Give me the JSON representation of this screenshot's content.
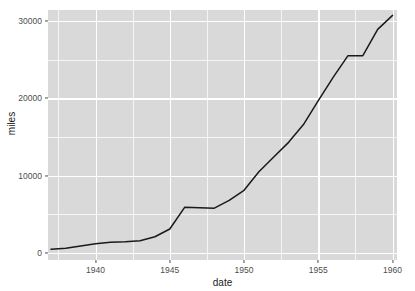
{
  "chart_data": {
    "type": "line",
    "title": "",
    "xlabel": "date",
    "ylabel": "miles",
    "xlim": [
      1936.8,
      1960.3
    ],
    "ylim": [
      -900,
      31400
    ],
    "grid": true,
    "legend": false,
    "x_ticks": [
      1940,
      1945,
      1950,
      1955,
      1960
    ],
    "x_tick_labels": [
      "1940",
      "1945",
      "1950",
      "1955",
      "1960"
    ],
    "x_minor_ticks": [
      1937.5,
      1942.5,
      1947.5,
      1952.5,
      1957.5
    ],
    "y_ticks": [
      0,
      10000,
      20000,
      30000
    ],
    "y_tick_labels": [
      "0",
      "10000",
      "20000",
      "30000"
    ],
    "y_minor_ticks": [
      5000,
      15000,
      25000
    ],
    "series": [
      {
        "name": "miles",
        "color": "#1a1a1a",
        "x": [
          1937,
          1938,
          1939,
          1940,
          1941,
          1942,
          1943,
          1944,
          1945,
          1946,
          1947,
          1948,
          1949,
          1950,
          1951,
          1952,
          1953,
          1954,
          1955,
          1956,
          1957,
          1958,
          1959,
          1960
        ],
        "values": [
          500,
          620,
          900,
          1200,
          1400,
          1450,
          1600,
          2100,
          3100,
          5900,
          5850,
          5800,
          6800,
          8100,
          10500,
          12400,
          14300,
          16600,
          19700,
          22700,
          25500,
          25500,
          28900,
          30700
        ]
      }
    ]
  },
  "axes": {
    "y_title": "miles",
    "x_title": "date"
  },
  "style": {
    "panel_bg": "#d9d9d9",
    "grid_color": "#ffffff",
    "line_color": "#1a1a1a",
    "tick_color": "#4d4d4d",
    "page_bg": "#ffffff"
  }
}
